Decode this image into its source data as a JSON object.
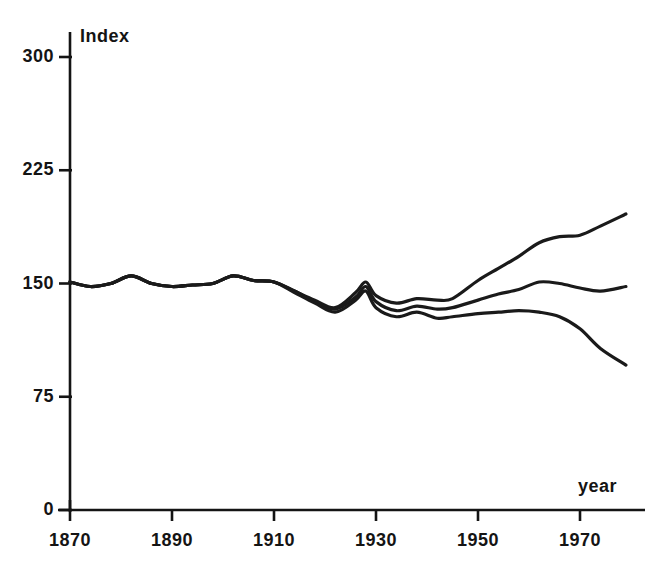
{
  "chart_data": {
    "type": "line",
    "title": "",
    "xlabel": "year",
    "ylabel": "Index",
    "xlim": [
      1870,
      1979
    ],
    "ylim": [
      0,
      300
    ],
    "xticks": [
      1870,
      1890,
      1910,
      1930,
      1950,
      1970
    ],
    "xticklabels": [
      "1870",
      "1890",
      "1910",
      "1930",
      "1950",
      "1970"
    ],
    "yticks": [
      0,
      75,
      150,
      225,
      300
    ],
    "yticklabels": [
      "0",
      "75",
      "150",
      "225",
      "300"
    ],
    "grid": false,
    "legend": false,
    "legend_position": "none",
    "line_color": "#1a1a1a",
    "note": "Three index curves coincide as a single thick line from 1870 to about 1918, then separate into an upper, middle and lower band.",
    "x": [
      1870,
      1874,
      1878,
      1882,
      1886,
      1890,
      1894,
      1898,
      1902,
      1906,
      1910,
      1914,
      1918,
      1922,
      1926,
      1928,
      1930,
      1934,
      1938,
      1942,
      1945,
      1950,
      1954,
      1958,
      1962,
      1966,
      1970,
      1974,
      1979
    ],
    "series": [
      {
        "name": "upper",
        "values": [
          151,
          148,
          150,
          155,
          150,
          148,
          149,
          150,
          155,
          152,
          151,
          145,
          139,
          134,
          144,
          151,
          142,
          137,
          140,
          139,
          140,
          152,
          160,
          168,
          177,
          181,
          182,
          188,
          196
        ]
      },
      {
        "name": "middle",
        "values": [
          151,
          148,
          150,
          155,
          150,
          148,
          149,
          150,
          155,
          152,
          151,
          145,
          138,
          133,
          141,
          148,
          138,
          132,
          135,
          133,
          134,
          139,
          143,
          146,
          151,
          150,
          147,
          145,
          148
        ]
      },
      {
        "name": "lower",
        "values": [
          151,
          148,
          150,
          155,
          150,
          148,
          149,
          150,
          155,
          152,
          151,
          144,
          137,
          131,
          139,
          145,
          134,
          128,
          131,
          127,
          128,
          130,
          131,
          132,
          131,
          128,
          120,
          107,
          96
        ]
      }
    ]
  },
  "axes": {
    "y_axis_title": "Index",
    "x_axis_title": "year"
  }
}
